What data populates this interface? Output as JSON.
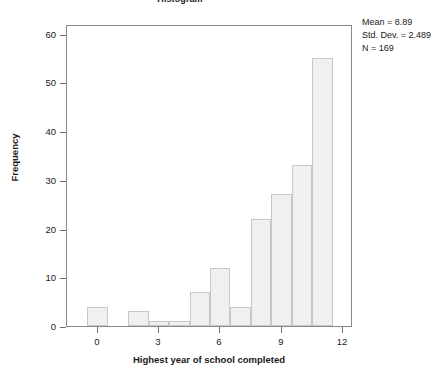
{
  "chart_data": {
    "type": "bar",
    "title": "Histogram",
    "xlabel": "Highest year of school completed",
    "ylabel": "Frequency",
    "x": [
      0,
      2,
      3,
      4,
      5,
      6,
      7,
      8,
      9,
      10,
      11
    ],
    "values": [
      4,
      3,
      1,
      1,
      7,
      12,
      4,
      22,
      27,
      33,
      55
    ],
    "categories": [
      "0",
      "2",
      "3",
      "4",
      "5",
      "6",
      "7",
      "8",
      "9",
      "10",
      "11"
    ],
    "bar_width": 1,
    "xlim": [
      -1.5,
      12.5
    ],
    "ylim": [
      0,
      62
    ],
    "xticks": [
      0,
      3,
      6,
      9,
      12
    ],
    "xtick_labels": [
      "0",
      "3",
      "6",
      "9",
      "12"
    ],
    "yticks": [
      0,
      10,
      20,
      30,
      40,
      50,
      60
    ],
    "ytick_labels": [
      "0",
      "10",
      "20",
      "30",
      "40",
      "50",
      "60"
    ],
    "grid": false,
    "legend": false,
    "bar_fill": "#f0f0f0",
    "bar_stroke": "#c8c8c8",
    "axis_color": "#8a8a8a"
  },
  "annotations": {
    "stats": [
      "Mean = 8.89",
      "Std. Dev. = 2.489",
      "N = 169"
    ]
  }
}
